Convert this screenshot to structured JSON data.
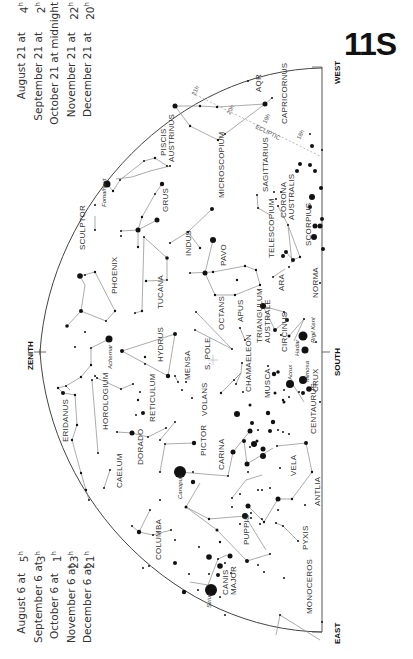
{
  "chart_title": "11S",
  "dates_top": {
    "rows": [
      {
        "date": "August 21 at",
        "time": "4",
        "unit": "h"
      },
      {
        "date": "September 21 at",
        "time": "2",
        "unit": "h"
      },
      {
        "date": "October 21 at midnight",
        "time": "",
        "unit": ""
      },
      {
        "date": "November 21 at",
        "time": "22",
        "unit": "h"
      },
      {
        "date": "December 21 at",
        "time": "20",
        "unit": "h"
      }
    ]
  },
  "dates_bottom": {
    "rows": [
      {
        "date": "August 6 at",
        "time": "5",
        "unit": "h"
      },
      {
        "date": "September 6 at",
        "time": "3",
        "unit": "h"
      },
      {
        "date": "October 6 at",
        "time": "1",
        "unit": "h"
      },
      {
        "date": "November 6 at",
        "time": "23",
        "unit": "h"
      },
      {
        "date": "December 6 at",
        "time": "21",
        "unit": "h"
      }
    ]
  },
  "directions": {
    "west": "WEST",
    "east": "EAST",
    "south": "SOUTH",
    "zenith": "ZENITH"
  },
  "markers": {
    "south_pole": "S. POLE",
    "ecliptic": "ECLIPTIC",
    "ecliptic_ticks": [
      "21h",
      "20h",
      "19h",
      "18h"
    ]
  },
  "constellations": {
    "aqr": "AQR",
    "capricornus": "CAPRICORNUS",
    "piscis_austrinus": [
      "PISCIS",
      "AUSTRINUS"
    ],
    "microscopium": "MICROSCOPIUM",
    "sagittarius": "SAGITTARIUS",
    "corona_australis": [
      "CORONA",
      "AUSTRALIS"
    ],
    "sculptor": "SCULPTOR",
    "grus": "GRUS",
    "indus": "INDUS",
    "telescopium": "TELESCOPIUM",
    "scorpius": "SCORPIUS",
    "phoenix": "PHOENIX",
    "tucana": "TUCANA",
    "pavo": "PAVO",
    "ara": "ARA",
    "norma": "NORMA",
    "octans": "OCTANS",
    "apus": "APUS",
    "triangulum_australe": [
      "TRIANGULUM",
      "AUSTRALE"
    ],
    "circinus": "CIRCINUS",
    "hydrus": "HYDRUS",
    "mensa": "MENSA",
    "chamaeleon": "CHAMAELEON",
    "musca": "MUSCA",
    "crux": "CRUX",
    "eridanus": "ERIDANUS",
    "horologium": "HOROLOGIUM",
    "reticulum": "RETICULUM",
    "volans": "VOLANS",
    "centaurus": "CENTAURUS",
    "dorado": "DORADO",
    "pictor": "PICTOR",
    "carina": "CARINA",
    "vela": "VELA",
    "caelum": "CAELUM",
    "antlia": "ANTLIA",
    "columba": "COLUMBA",
    "puppis": "PUPPIS",
    "pyxis": "PYXIS",
    "canis_major": [
      "CANIS",
      "MAJOR"
    ],
    "monoceros": "MONOCEROS"
  },
  "stars": {
    "fomalhaut": "Fomalhaut",
    "achernar": "Achernar",
    "canopus": "Canopus",
    "sirius": "Sirius",
    "rigil_kent": "Rigil Kent",
    "hadar": "Hadar",
    "mimosa": "Mimosa",
    "acrux": "Acrux"
  }
}
